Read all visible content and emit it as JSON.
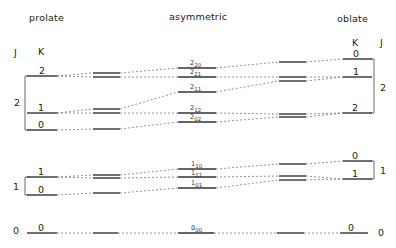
{
  "headers": {
    "prolate": "prolate",
    "asymmetric": "asymmetric",
    "oblate": "oblate"
  },
  "axis_labels": {
    "left_J": "J",
    "left_K": "K",
    "right_K": "K",
    "right_J": "J"
  },
  "prolate": {
    "J_groups": [
      {
        "J": "2",
        "K_levels": [
          "2",
          "1",
          "0"
        ]
      },
      {
        "J": "1",
        "K_levels": [
          "1",
          "0"
        ]
      },
      {
        "J": "0",
        "K_levels": [
          "0"
        ]
      }
    ]
  },
  "asymmetric": {
    "levels": [
      {
        "J": "2",
        "sub": "20"
      },
      {
        "J": "2",
        "sub": "21"
      },
      {
        "J": "2",
        "sub": "11"
      },
      {
        "J": "2",
        "sub": "12"
      },
      {
        "J": "2",
        "sub": "02"
      },
      {
        "J": "1",
        "sub": "10"
      },
      {
        "J": "1",
        "sub": "11"
      },
      {
        "J": "1",
        "sub": "01"
      },
      {
        "J": "0",
        "sub": "00"
      }
    ]
  },
  "oblate": {
    "J_groups": [
      {
        "J": "2",
        "K_levels": [
          "0",
          "1",
          "2"
        ]
      },
      {
        "J": "1",
        "K_levels": [
          "0",
          "1"
        ]
      },
      {
        "J": "0",
        "K_levels": [
          "0"
        ]
      }
    ]
  }
}
